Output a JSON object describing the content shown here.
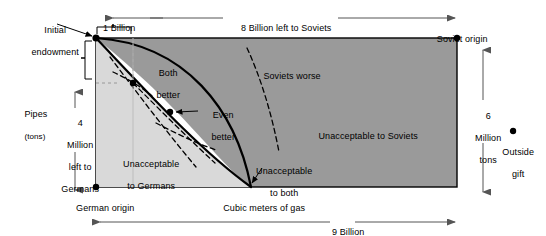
{
  "figure": {
    "title_absent": true,
    "type": "edgeworth-box-diagram",
    "background": "#ffffff"
  },
  "colors": {
    "soviet_region_fill": "#9a9a9a",
    "german_region_fill": "#d9d9d9",
    "lens_fill": "#ffffff",
    "stroke": "#000000",
    "arrow": "#555555"
  },
  "box": {
    "german_origin_label": "German origin",
    "soviet_origin_label": "Soviet origin",
    "x_axis_label": "Cubic meters of gas",
    "y_axis_label_line1": "Pipes",
    "y_axis_label_line2": "(tons)"
  },
  "dimensions": {
    "top_left_span": "1 Billion",
    "top_right_span": "8 Billion left to Soviets",
    "bottom_span": "9 Billion",
    "left_span_line1": "4",
    "left_span_line2": "Million",
    "left_span_line3": "left to",
    "left_span_line4": "Germans",
    "right_span_line1": "6",
    "right_span_line2": "Million",
    "right_span_line3": "tons"
  },
  "annotations": {
    "initial_endowment_line1": "Initial",
    "initial_endowment_line2": "endowment",
    "both_better_line1": "Both",
    "both_better_line2": "better",
    "even_better_line1": "Even",
    "even_better_line2": "better",
    "soviets_worse": "Soviets worse",
    "unacceptable_to_soviets": "Unacceptable to Soviets",
    "unacceptable_to_germans_line1": "Unacceptable",
    "unacceptable_to_germans_line2": "to Germans",
    "unacceptable_to_both_line1": "Unacceptable",
    "unacceptable_to_both_line2": "to both",
    "outside_gift_line1": "Outside",
    "outside_gift_line2": "gift"
  },
  "points": [
    {
      "name": "initial-endowment-point",
      "x": 96,
      "y": 38
    },
    {
      "name": "german-origin-point",
      "x": 96,
      "y": 187
    },
    {
      "name": "soviet-origin-point",
      "x": 457,
      "y": 38
    },
    {
      "name": "both-better-point",
      "x": 133,
      "y": 83
    },
    {
      "name": "even-better-point",
      "x": 170,
      "y": 112
    },
    {
      "name": "outside-gift-point",
      "x": 513,
      "y": 131
    }
  ]
}
